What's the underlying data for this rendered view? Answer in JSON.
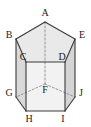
{
  "figure": {
    "name": "pentagonal-prism",
    "background_color": "#ffffff",
    "stroke_color": "#3a3a3a",
    "hidden_stroke_color": "#8c8c8c",
    "top_face_fill": "#e8e8e8",
    "left_face_fill": "#d8d8d8",
    "front_left_face_fill": "#f1f1f1",
    "front_right_face_fill": "#ececec",
    "right_face_fill": "#d4d4d4",
    "bottom_band_fill": "#e0e0e0",
    "label_color": "#1b1b1b",
    "stroke_width": 1.1,
    "hidden_stroke_width": 0.9,
    "hidden_dash_pattern": "2,2"
  },
  "vertices": [
    {
      "id": "A",
      "label": "A",
      "x": 45,
      "y": 22,
      "label_x": 45,
      "label_y": 13,
      "hidden": false,
      "role": "top-back-apex"
    },
    {
      "id": "B",
      "label": "B",
      "x": 16,
      "y": 39,
      "label_x": 9,
      "label_y": 35,
      "hidden": false,
      "role": "top-left"
    },
    {
      "id": "C",
      "label": "C",
      "x": 26,
      "y": 62,
      "label_x": 23,
      "label_y": 57,
      "hidden": false,
      "role": "top-front-left"
    },
    {
      "id": "D",
      "label": "D",
      "x": 65,
      "y": 62,
      "label_x": 62,
      "label_y": 57,
      "hidden": false,
      "role": "top-front-right"
    },
    {
      "id": "E",
      "label": "E",
      "x": 75,
      "y": 39,
      "label_x": 82,
      "label_y": 35,
      "hidden": false,
      "role": "top-right"
    },
    {
      "id": "F",
      "label": "F",
      "x": 45,
      "y": 84,
      "label_x": 45,
      "label_y": 90,
      "hidden": true,
      "role": "bottom-back-apex"
    },
    {
      "id": "G",
      "label": "G",
      "x": 16,
      "y": 97,
      "label_x": 9,
      "label_y": 93,
      "hidden": false,
      "role": "bottom-left"
    },
    {
      "id": "H",
      "label": "H",
      "x": 26,
      "y": 111,
      "label_x": 29,
      "label_y": 119,
      "hidden": false,
      "role": "bottom-front-left"
    },
    {
      "id": "I",
      "label": "I",
      "x": 65,
      "y": 111,
      "label_x": 63,
      "label_y": 119,
      "hidden": false,
      "role": "bottom-front-right"
    },
    {
      "id": "J",
      "label": "J",
      "x": 75,
      "y": 97,
      "label_x": 81,
      "label_y": 93,
      "hidden": false,
      "role": "bottom-right"
    }
  ],
  "faces": [
    {
      "id": "top",
      "points": "45,22 16,39 26,62 65,62 75,39",
      "fill": "#e9e9e9"
    },
    {
      "id": "left",
      "points": "16,39 26,62 26,111 16,97",
      "fill": "#d9d9d9"
    },
    {
      "id": "front",
      "points": "26,62 65,62 65,111 26,111",
      "fill": "#f2f2f2"
    },
    {
      "id": "right",
      "points": "65,62 75,39 75,97 65,111",
      "fill": "#d5d5d5"
    }
  ],
  "edges": [
    {
      "from": "A",
      "to": "B",
      "hidden": false
    },
    {
      "from": "B",
      "to": "C",
      "hidden": false
    },
    {
      "from": "C",
      "to": "D",
      "hidden": false
    },
    {
      "from": "D",
      "to": "E",
      "hidden": false
    },
    {
      "from": "E",
      "to": "A",
      "hidden": false
    },
    {
      "from": "G",
      "to": "H",
      "hidden": false
    },
    {
      "from": "H",
      "to": "I",
      "hidden": false
    },
    {
      "from": "I",
      "to": "J",
      "hidden": false
    },
    {
      "from": "B",
      "to": "G",
      "hidden": false
    },
    {
      "from": "C",
      "to": "H",
      "hidden": false
    },
    {
      "from": "D",
      "to": "I",
      "hidden": false
    },
    {
      "from": "E",
      "to": "J",
      "hidden": false
    },
    {
      "from": "F",
      "to": "G",
      "hidden": true
    },
    {
      "from": "F",
      "to": "J",
      "hidden": true
    },
    {
      "from": "A",
      "to": "F",
      "hidden": true
    }
  ]
}
